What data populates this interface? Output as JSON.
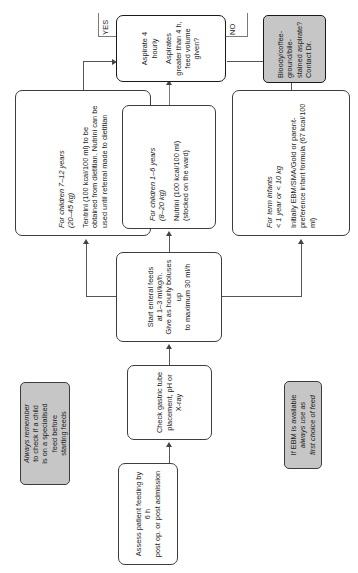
{
  "diagram": {
    "colors": {
      "note_fill": "#c6c6c6",
      "node_fill": "#ffffff",
      "stroke": "#3d3d3d",
      "emphasis_stroke": "#1a1a1a",
      "connector": "#555555"
    },
    "notes": {
      "specialised_feed": {
        "lines": [
          "Always remember",
          "to check if a child",
          "is on a specialised",
          "feed before",
          "starting feeds"
        ],
        "text": "Always remember to check if a child is on a specialised feed before starting feeds"
      },
      "ebm": {
        "lines": [
          "If EBM is available",
          "always use as",
          "first choice of feed"
        ],
        "text": "If EBM is available always use as first choice of feed"
      },
      "aspirate_alert": {
        "lines": [
          "Bloody/coffee-",
          "ground/bile-",
          "stained aspirate?",
          "Contact Dr."
        ],
        "text": "Bloody/coffee-ground/bile-stained aspirate? Contact Dr."
      }
    },
    "nodes": {
      "assess": {
        "lines": [
          "Assess patient feeding by 6 h",
          "post op. or post admission"
        ]
      },
      "check_tube": {
        "lines": [
          "Check gastric tube",
          "placement, pH or X-ray"
        ]
      },
      "start_feeds": {
        "lines": [
          "Start enteral feeds",
          "at 1–3 ml/kg/h.",
          "Give as hourly boluses up",
          "to maximum 30 ml/h"
        ]
      },
      "children_7_12": {
        "heading": "For children 7–12 years",
        "subheading": "(20–45 kg)",
        "body": "Tentrini (100 kcal/100 ml) to be obtained from dietitian. Nutrini can be used until referral made to dietitian"
      },
      "children_1_6": {
        "heading": "For children 1–6 years",
        "subheading": "(8–20 kg)",
        "body": "Nutrini (100 kcal/100 ml) (stocked on the ward)"
      },
      "term_infants": {
        "heading": "For term infants",
        "subheading": "< 1 year or < 10 kg",
        "body": "Initially EBM/SMA/Gold or parent-preference infant formula (67 kcal/100 ml)"
      },
      "aspirate": {
        "line1": "Aspirate 4 hourly",
        "line2": "Aspirates greater than 4 h, feed volume given?"
      }
    },
    "edge_labels": {
      "yes": "YES",
      "no": "NO"
    }
  }
}
